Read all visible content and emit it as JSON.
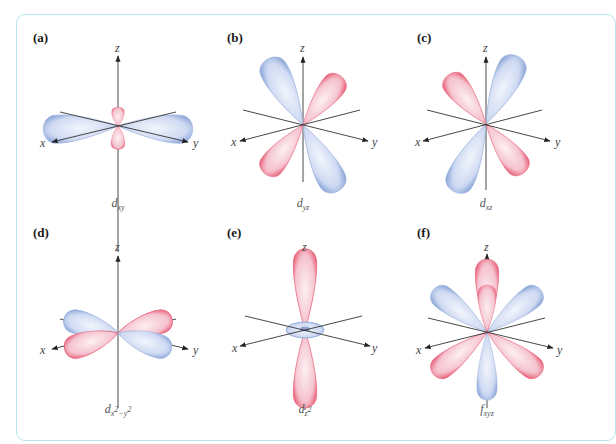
{
  "figure": {
    "border_color": "#b9e6ea",
    "colors": {
      "positive_lobe": "#e8627a",
      "negative_lobe": "#8aa6d8",
      "axis": "#333333"
    },
    "panels": [
      {
        "id": "a",
        "label": "(a)",
        "orbital": "d",
        "subscript": "xy",
        "axes": {
          "x": "x",
          "y": "y",
          "z": "z"
        }
      },
      {
        "id": "b",
        "label": "(b)",
        "orbital": "d",
        "subscript": "yz",
        "axes": {
          "x": "x",
          "y": "y",
          "z": "z"
        }
      },
      {
        "id": "c",
        "label": "(c)",
        "orbital": "d",
        "subscript": "xz",
        "axes": {
          "x": "x",
          "y": "y",
          "z": "z"
        }
      },
      {
        "id": "d",
        "label": "(d)",
        "orbital": "d",
        "subscript_main": "x",
        "sup1": "2",
        "minus": "−",
        "subscript_y": "y",
        "sup2": "2",
        "axes": {
          "x": "x",
          "y": "y",
          "z": "z"
        }
      },
      {
        "id": "e",
        "label": "(e)",
        "orbital": "d",
        "subscript_main": "z",
        "sup1": "2",
        "axes": {
          "x": "x",
          "y": "y",
          "z": "z"
        }
      },
      {
        "id": "f",
        "label": "(f)",
        "orbital": "f",
        "subscript": "xyz",
        "axes": {
          "x": "x",
          "y": "y",
          "z": "z"
        }
      }
    ]
  }
}
